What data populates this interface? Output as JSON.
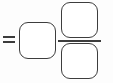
{
  "diagram": {
    "kind": "math-equation-placeholder",
    "background_color": "#fdfdfd",
    "stroke_color": "#3d3d3d",
    "fill_color": "#ffffff",
    "expression": "= □ □/□",
    "operator": {
      "name": "equals",
      "symbol": "=",
      "label": "equals sign"
    },
    "left_operand": {
      "name": "empty-box",
      "label": "",
      "shape": "rounded-square",
      "content": ""
    },
    "fraction": {
      "label": "fraction",
      "numerator": {
        "name": "empty-box",
        "label": "",
        "shape": "rounded-square",
        "content": ""
      },
      "denominator": {
        "name": "empty-box",
        "label": "",
        "shape": "rounded-square",
        "content": ""
      },
      "bar_label": "fraction bar"
    }
  }
}
